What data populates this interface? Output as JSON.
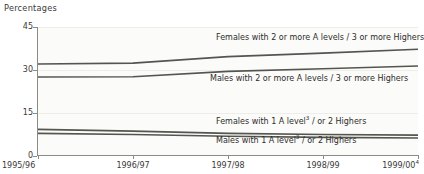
{
  "chart_data": {
    "type": "line",
    "title": "Percentages",
    "xlabel": "",
    "ylabel": "Percentages",
    "ylim": [
      0,
      45
    ],
    "yticks": [
      0,
      15,
      30,
      45
    ],
    "grid": true,
    "legend_position": "inline-labels",
    "categories": [
      "1995/96",
      "1996/97",
      "1997/98",
      "1998/99",
      "1999/00"
    ],
    "series": [
      {
        "name": "Females with 2 or more A levels / 3 or more Highers",
        "label": "Females with 2 or more A levels / 3 or more Highers",
        "values": [
          32.0,
          32.3,
          34.6,
          35.8,
          37.2
        ]
      },
      {
        "name": "Males with 2 or more A levels / 3 or more Highers",
        "label": "Males with 2 or more A levels / 3 or more Highers",
        "values": [
          27.4,
          27.5,
          29.4,
          30.3,
          31.3
        ]
      },
      {
        "name": "Females with 1 A level / or 2 Highers",
        "label": "Females with 1 A level",
        "label_suffix": " / or 2 Highers",
        "footnote_marker": "3",
        "values": [
          9.0,
          8.4,
          7.6,
          7.2,
          7.0
        ]
      },
      {
        "name": "Males with 1 A level / or 2 Highers",
        "label": "Males with 1 A level",
        "label_suffix": " / or 2 Highers",
        "footnote_marker": "3",
        "values": [
          7.6,
          7.2,
          6.6,
          6.2,
          6.0
        ]
      }
    ]
  },
  "axis": {
    "y_label_45": "45",
    "y_label_30": "30",
    "y_label_15": "15",
    "y_label_0": "0",
    "x_label_1": "1995/96",
    "x_label_2": "1996/97",
    "x_label_3": "1997/98",
    "x_label_4": "1998/99",
    "x_label_5": "1999/00",
    "x_label_5_marker": "4"
  },
  "labels": {
    "females_2plus": "Females with 2 or more A levels / 3 or more Highers",
    "males_2plus": "Males with 2 or more A levels / 3 or more Highers",
    "females_1_prefix": "Females with 1 A level",
    "females_1_marker": "3",
    "females_1_suffix": " / or 2 Highers",
    "males_1_prefix": "Males with 1 A level",
    "males_1_marker": "3",
    "males_1_suffix": " / or 2 Highers"
  },
  "colors": {
    "line": "#55554f",
    "grid": "#ededea",
    "axis": "#8c8c86",
    "text": "#3a3a38",
    "plot_bg": "#fbfbfa"
  }
}
